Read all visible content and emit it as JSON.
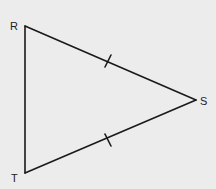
{
  "diagram": {
    "type": "triangle",
    "background": "#ececec",
    "stroke": "#1a1a1a",
    "vertices": [
      {
        "label": "R",
        "x": 25,
        "y": 26
      },
      {
        "label": "S",
        "x": 196,
        "y": 100
      },
      {
        "label": "T",
        "x": 25,
        "y": 173
      }
    ],
    "sides": [
      {
        "from": "R",
        "to": "S",
        "tick_marks": 1
      },
      {
        "from": "S",
        "to": "T",
        "tick_marks": 1
      },
      {
        "from": "T",
        "to": "R",
        "tick_marks": 0
      }
    ],
    "labels": {
      "R": "R",
      "S": "S",
      "T": "T"
    }
  }
}
